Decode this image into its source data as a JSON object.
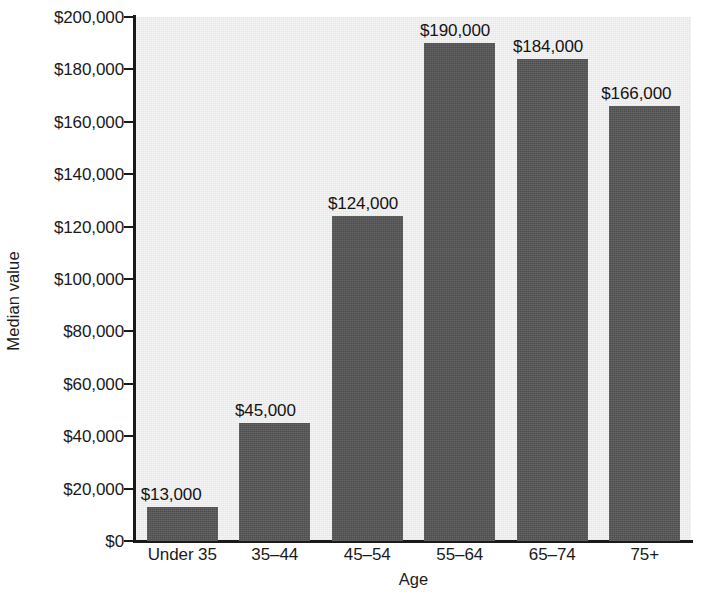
{
  "chart_data": {
    "type": "bar",
    "title": "",
    "subtitle": "",
    "xlabel": "Age",
    "ylabel": "Median value",
    "categories": [
      "Under 35",
      "35–44",
      "45–54",
      "55–64",
      "65–74",
      "75+"
    ],
    "values": [
      13000,
      45000,
      124000,
      190000,
      184000,
      166000
    ],
    "data_labels": [
      "$13,000",
      "$45,000",
      "$124,000",
      "$190,000",
      "$184,000",
      "$166,000"
    ],
    "ylim": [
      0,
      200000
    ],
    "ytick_values": [
      0,
      20000,
      40000,
      60000,
      80000,
      100000,
      120000,
      140000,
      160000,
      180000,
      200000
    ],
    "ytick_labels": [
      "$0",
      "$20,000",
      "$40,000",
      "$60,000",
      "$80,000",
      "$100,000",
      "$120,000",
      "$140,000",
      "$160,000",
      "$180,000",
      "$200,000"
    ],
    "grid": false,
    "legend": false,
    "legend_position": "none",
    "series": [
      {
        "name": "Median value",
        "values": [
          13000,
          45000,
          124000,
          190000,
          184000,
          166000
        ]
      }
    ],
    "colors": {
      "bar_fill": "#555555",
      "plot_background": "#ececec",
      "figure_background": "#ffffff",
      "axis": "#1a1a1a",
      "text": "#1a1a1a"
    }
  },
  "footer": {
    "bleed_text": "                                   "
  }
}
